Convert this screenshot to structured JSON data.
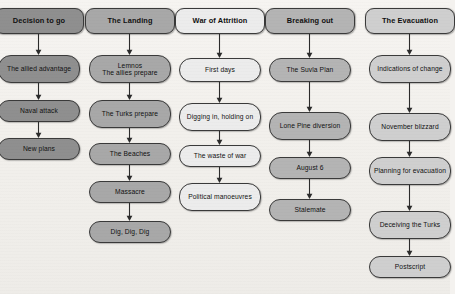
{
  "diagram": {
    "background_color": "#f2f0ec",
    "columns": [
      {
        "id": "decision-to-go",
        "header": "Decision to go",
        "fill": "#8f8f8f",
        "left": -6,
        "steps": [
          {
            "label": "The allied advantage",
            "top": 55,
            "height": 28
          },
          {
            "label": "Naval attack",
            "top": 100,
            "height": 22
          },
          {
            "label": "New plans",
            "top": 138,
            "height": 22
          }
        ]
      },
      {
        "id": "the-landing",
        "header": "The Landing",
        "fill": "#a8a8a8",
        "left": 85,
        "steps": [
          {
            "label": "Lemnos\nThe allies prepare",
            "top": 55,
            "height": 28
          },
          {
            "label": "The Turks prepare",
            "top": 100,
            "height": 28
          },
          {
            "label": "The Beaches",
            "top": 143,
            "height": 22
          },
          {
            "label": "Massacre",
            "top": 181,
            "height": 22
          },
          {
            "label": "Dig, Dig, Dig",
            "top": 221,
            "height": 22
          }
        ]
      },
      {
        "id": "war-of-attrition",
        "header": "War of Attrition",
        "fill": "#ececec",
        "left": 175,
        "steps": [
          {
            "label": "First days",
            "top": 58,
            "height": 24
          },
          {
            "label": "Digging in, holding on",
            "top": 103,
            "height": 28
          },
          {
            "label": "The waste of war",
            "top": 145,
            "height": 22
          },
          {
            "label": "Political manoeuvres",
            "top": 183,
            "height": 28
          }
        ]
      },
      {
        "id": "breaking-out",
        "header": "Breaking out",
        "fill": "#b4b4b4",
        "left": 265,
        "steps": [
          {
            "label": "The Suvla Plan",
            "top": 58,
            "height": 24
          },
          {
            "label": "Lone Pine diversion",
            "top": 112,
            "height": 28
          },
          {
            "label": "August 6",
            "top": 157,
            "height": 22
          },
          {
            "label": "Stalemate",
            "top": 199,
            "height": 22
          }
        ]
      },
      {
        "id": "the-evacuation",
        "header": "The Evacuation",
        "fill": "#cfcfcf",
        "left": 365,
        "steps": [
          {
            "label": "Indications of change",
            "top": 55,
            "height": 28
          },
          {
            "label": "November blizzard",
            "top": 113,
            "height": 28
          },
          {
            "label": "Planning for evacuation",
            "top": 157,
            "height": 28
          },
          {
            "label": "Deceiving the Turks",
            "top": 211,
            "height": 28
          },
          {
            "label": "Postscript",
            "top": 256,
            "height": 22
          }
        ]
      }
    ],
    "header_geometry": {
      "top": 8,
      "height": 26
    },
    "arrow_color": "#2b2b2b"
  }
}
